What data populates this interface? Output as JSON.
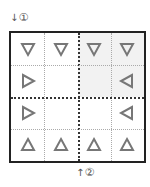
{
  "labels": {
    "top": {
      "arrow": "↓",
      "text": "①"
    },
    "bottom": {
      "arrow": "↑",
      "text": "②"
    }
  },
  "grid": {
    "rows": 4,
    "cols": 4,
    "shaded_quadrant": "top-right",
    "cells": [
      [
        "down",
        "down",
        "down",
        "down"
      ],
      [
        "right",
        "",
        "",
        "left"
      ],
      [
        "right",
        "",
        "",
        "left"
      ],
      [
        "up",
        "up",
        "up",
        "up"
      ]
    ]
  },
  "colors": {
    "triangle": "#777777",
    "shade": "#f2f2f2",
    "border": "#222222"
  }
}
